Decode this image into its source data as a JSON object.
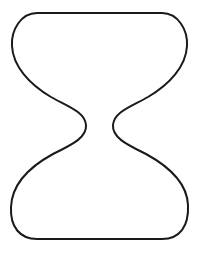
{
  "figure": {
    "shape": "hourglass-outline",
    "stroke_color": "#1a1a1a",
    "fill_color": "#ffffff",
    "background_color": "#ffffff",
    "stroke_width": 2
  }
}
